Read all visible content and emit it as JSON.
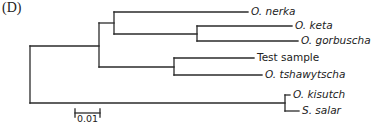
{
  "figure": {
    "panel_label": "(D)",
    "type": "phylogenetic-tree",
    "line_color": "#2a2a2a",
    "text_color": "#222222"
  },
  "taxa": [
    {
      "label": "O. nerka",
      "italic": true,
      "y": 12,
      "x_end": 248
    },
    {
      "label": "O. keta",
      "italic": true,
      "y": 26,
      "x_end": 292
    },
    {
      "label": "O. gorbuscha",
      "italic": true,
      "y": 41,
      "x_end": 298
    },
    {
      "label": "Test sample",
      "italic": false,
      "y": 58,
      "x_end": 254
    },
    {
      "label": "O. tshawytscha",
      "italic": true,
      "y": 75,
      "x_end": 262
    },
    {
      "label": "O. kisutch",
      "italic": true,
      "y": 95,
      "x_end": 290
    },
    {
      "label": "S. salar",
      "italic": true,
      "y": 111,
      "x_end": 299
    }
  ],
  "scale_bar": {
    "label": "0.01",
    "x1": 75,
    "x2": 100,
    "y": 113
  }
}
